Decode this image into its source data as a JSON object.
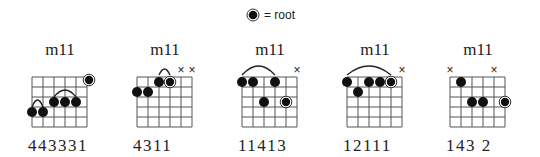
{
  "legend": {
    "symbol": "root-dot-icon",
    "label": "= root"
  },
  "chords": [
    {
      "name": "m11",
      "fingering": "443331",
      "left": 20,
      "muted": [],
      "dots": [
        {
          "string": 6,
          "fret": 4
        },
        {
          "string": 5,
          "fret": 4
        },
        {
          "string": 4,
          "fret": 3
        },
        {
          "string": 3,
          "fret": 3
        },
        {
          "string": 2,
          "fret": 3
        },
        {
          "string": 1,
          "fret": 1,
          "root": true,
          "edge": true
        }
      ],
      "arcs": [
        {
          "from": 6,
          "to": 5,
          "fret": 4
        },
        {
          "from": 4,
          "to": 2,
          "fret": 3
        }
      ]
    },
    {
      "name": "m11",
      "fingering": "4311",
      "left": 125,
      "muted": [
        2,
        1
      ],
      "dots": [
        {
          "string": 6,
          "fret": 2
        },
        {
          "string": 5,
          "fret": 2
        },
        {
          "string": 4,
          "fret": 1
        },
        {
          "string": 3,
          "fret": 1,
          "root": true
        }
      ],
      "arcs": [
        {
          "from": 4,
          "to": 3,
          "fret": 0
        }
      ]
    },
    {
      "name": "m11",
      "fingering": "11413",
      "left": 230,
      "muted": [
        1
      ],
      "dots": [
        {
          "string": 6,
          "fret": 1
        },
        {
          "string": 5,
          "fret": 1
        },
        {
          "string": 4,
          "fret": 3
        },
        {
          "string": 3,
          "fret": 1
        },
        {
          "string": 2,
          "fret": 3,
          "root": true
        }
      ],
      "arcs": [
        {
          "from": 6,
          "to": 3,
          "fret": 0
        }
      ]
    },
    {
      "name": "m11",
      "fingering": "12111",
      "left": 335,
      "muted": [
        1
      ],
      "dots": [
        {
          "string": 6,
          "fret": 1
        },
        {
          "string": 5,
          "fret": 2
        },
        {
          "string": 4,
          "fret": 1
        },
        {
          "string": 3,
          "fret": 1
        },
        {
          "string": 2,
          "fret": 1,
          "root": true
        }
      ],
      "arcs": [
        {
          "from": 6,
          "to": 2,
          "fret": 0
        }
      ]
    },
    {
      "name": "m11",
      "fingering": "143 2",
      "left": 438,
      "muted": [
        6,
        2
      ],
      "dots": [
        {
          "string": 5,
          "fret": 1
        },
        {
          "string": 4,
          "fret": 3
        },
        {
          "string": 3,
          "fret": 3
        },
        {
          "string": 1,
          "fret": 3,
          "root": true
        }
      ],
      "arcs": []
    }
  ]
}
